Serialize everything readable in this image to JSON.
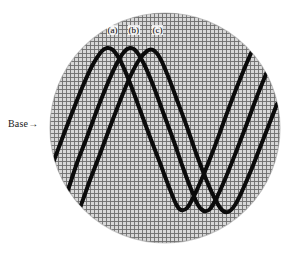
{
  "figure": {
    "type": "oscilloscope-waveform-photo",
    "background_color": "#ffffff",
    "grid": {
      "color": "#6e6e6e",
      "spacing_px": 4,
      "major_spacing_px": 20,
      "major_color": "#3a3a3a"
    },
    "screen": {
      "shape": "circle",
      "center_x": 165,
      "center_y": 128,
      "radius": 115,
      "fill_color": "#d8d8d8",
      "edge_color": "#9a9a9a"
    },
    "trace": {
      "color": "#0b0b0b",
      "width_px": 4
    }
  },
  "annotations": {
    "base": {
      "text": "Base",
      "arrow": "→",
      "x": 8,
      "y": 118
    },
    "wave_labels": [
      {
        "id": "a",
        "text": "(a)",
        "x": 107,
        "y": 25
      },
      {
        "id": "b",
        "text": "(b)",
        "x": 128,
        "y": 25
      },
      {
        "id": "c",
        "text": "(c)",
        "x": 152,
        "y": 25
      }
    ]
  },
  "chart_data": {
    "type": "line",
    "title": "",
    "xlabel": "",
    "ylabel": "",
    "grid": true,
    "legend_position": "top-inside",
    "xlim": [
      50,
      280
    ],
    "ylim": [
      13,
      243
    ],
    "annotations": [
      "Base",
      "(a)",
      "(b)",
      "(c)"
    ],
    "series": [
      {
        "name": "(a)",
        "label_x": 113,
        "peak_x": 105,
        "peak_y": 49,
        "trough_x": 178,
        "trough_y": 210,
        "points": [
          [
            53,
            163
          ],
          [
            62,
            139
          ],
          [
            72,
            113
          ],
          [
            82,
            88
          ],
          [
            92,
            66
          ],
          [
            101,
            52
          ],
          [
            107,
            48
          ],
          [
            113,
            50
          ],
          [
            121,
            62
          ],
          [
            130,
            83
          ],
          [
            140,
            110
          ],
          [
            150,
            137
          ],
          [
            160,
            163
          ],
          [
            169,
            187
          ],
          [
            176,
            204
          ],
          [
            181,
            210
          ],
          [
            187,
            208
          ],
          [
            194,
            196
          ],
          [
            203,
            176
          ],
          [
            213,
            151
          ],
          [
            223,
            124
          ],
          [
            233,
            97
          ],
          [
            243,
            72
          ],
          [
            252,
            51
          ],
          [
            259,
            37
          ]
        ]
      },
      {
        "name": "(b)",
        "label_x": 134,
        "peak_x": 128,
        "peak_y": 49,
        "trough_x": 202,
        "trough_y": 211,
        "points": [
          [
            60,
            213
          ],
          [
            68,
            190
          ],
          [
            77,
            163
          ],
          [
            87,
            137
          ],
          [
            97,
            110
          ],
          [
            107,
            85
          ],
          [
            116,
            65
          ],
          [
            124,
            52
          ],
          [
            130,
            48
          ],
          [
            136,
            51
          ],
          [
            144,
            64
          ],
          [
            153,
            85
          ],
          [
            163,
            112
          ],
          [
            173,
            139
          ],
          [
            182,
            165
          ],
          [
            191,
            189
          ],
          [
            198,
            205
          ],
          [
            204,
            211
          ],
          [
            210,
            209
          ],
          [
            217,
            197
          ],
          [
            226,
            177
          ],
          [
            236,
            152
          ],
          [
            246,
            126
          ],
          [
            256,
            99
          ],
          [
            266,
            74
          ],
          [
            273,
            56
          ]
        ]
      },
      {
        "name": "(c)",
        "label_x": 158,
        "peak_x": 150,
        "peak_y": 50,
        "trough_x": 225,
        "trough_y": 212,
        "points": [
          [
            72,
            225
          ],
          [
            81,
            205
          ],
          [
            90,
            180
          ],
          [
            100,
            154
          ],
          [
            110,
            127
          ],
          [
            120,
            101
          ],
          [
            130,
            77
          ],
          [
            139,
            60
          ],
          [
            147,
            51
          ],
          [
            153,
            50
          ],
          [
            160,
            58
          ],
          [
            168,
            76
          ],
          [
            177,
            100
          ],
          [
            187,
            127
          ],
          [
            196,
            153
          ],
          [
            206,
            179
          ],
          [
            215,
            199
          ],
          [
            222,
            210
          ],
          [
            228,
            212
          ],
          [
            235,
            205
          ],
          [
            243,
            189
          ],
          [
            252,
            168
          ],
          [
            261,
            145
          ],
          [
            270,
            122
          ],
          [
            277,
            104
          ]
        ]
      }
    ]
  }
}
